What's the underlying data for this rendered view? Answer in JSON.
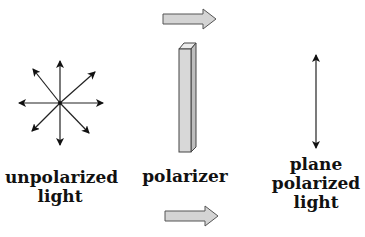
{
  "diagram": {
    "labels": {
      "unpolarized": [
        "unpolarized",
        "light"
      ],
      "polarizer": "polarizer",
      "polarized": [
        "plane",
        "polarized",
        "light"
      ]
    },
    "icons": {
      "top_arrow": "direction-arrow-icon",
      "bottom_arrow": "direction-arrow-icon",
      "polarizer": "polarizer-bar",
      "unpolarized": "multi-direction-arrows-icon",
      "polarized": "double-vertical-arrow-icon"
    },
    "colors": {
      "arrow_fill": "#d4d4d4",
      "arrow_stroke": "#555555",
      "polarizer_fill": "#d8d8d8",
      "line": "#222222"
    }
  }
}
